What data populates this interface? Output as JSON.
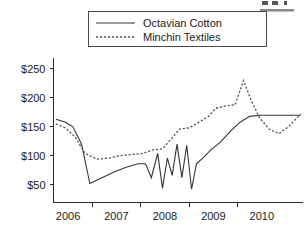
{
  "chart_data": {
    "type": "line",
    "title": "",
    "xlabel": "",
    "ylabel": "",
    "xlim": [
      2005.7,
      2010.85
    ],
    "ylim": [
      20,
      262
    ],
    "grid": false,
    "legend_position": "top-center",
    "y_ticks": [
      50,
      100,
      150,
      200,
      250
    ],
    "y_tick_labels": [
      "$50",
      "$100",
      "$150",
      "$200",
      "$250"
    ],
    "x_ticks": [
      2006,
      2007,
      2008,
      2009,
      2010
    ],
    "x_tick_labels": [
      "2006",
      "2007",
      "2008",
      "2009",
      "2010"
    ],
    "series": [
      {
        "name": "Octavian Cotton",
        "style": "solid",
        "color": "#333333",
        "x": [
          2005.75,
          2005.95,
          2006.1,
          2006.28,
          2006.45,
          2006.7,
          2006.95,
          2007.2,
          2007.45,
          2007.6,
          2007.72,
          2007.85,
          2007.95,
          2008.05,
          2008.15,
          2008.25,
          2008.35,
          2008.45,
          2008.55,
          2008.65,
          2008.78,
          2008.95,
          2009.15,
          2009.35,
          2009.55,
          2009.75,
          2009.95,
          2010.2,
          2010.5,
          2010.8
        ],
        "y": [
          163,
          158,
          150,
          120,
          52,
          62,
          72,
          80,
          86,
          86,
          62,
          104,
          44,
          96,
          66,
          120,
          62,
          118,
          42,
          86,
          96,
          110,
          124,
          142,
          158,
          168,
          170,
          170,
          170,
          170
        ]
      },
      {
        "name": "Minchin Textiles",
        "style": "dotted",
        "color": "#555555",
        "x": [
          2005.75,
          2005.95,
          2006.15,
          2006.35,
          2006.6,
          2006.85,
          2007.05,
          2007.3,
          2007.55,
          2007.75,
          2007.95,
          2008.12,
          2008.3,
          2008.5,
          2008.7,
          2008.9,
          2009.05,
          2009.25,
          2009.45,
          2009.62,
          2009.78,
          2009.95,
          2010.15,
          2010.35,
          2010.55,
          2010.8
        ],
        "y": [
          155,
          148,
          132,
          104,
          94,
          96,
          100,
          102,
          104,
          110,
          112,
          128,
          146,
          148,
          158,
          168,
          182,
          186,
          188,
          230,
          196,
          166,
          146,
          138,
          150,
          172
        ]
      }
    ],
    "legend": [
      {
        "label": "Octavian Cotton",
        "style": "solid"
      },
      {
        "label": "Minchin Textiles",
        "style": "dotted"
      }
    ]
  },
  "cropped_text_fragments": {
    "top_right": "..."
  }
}
